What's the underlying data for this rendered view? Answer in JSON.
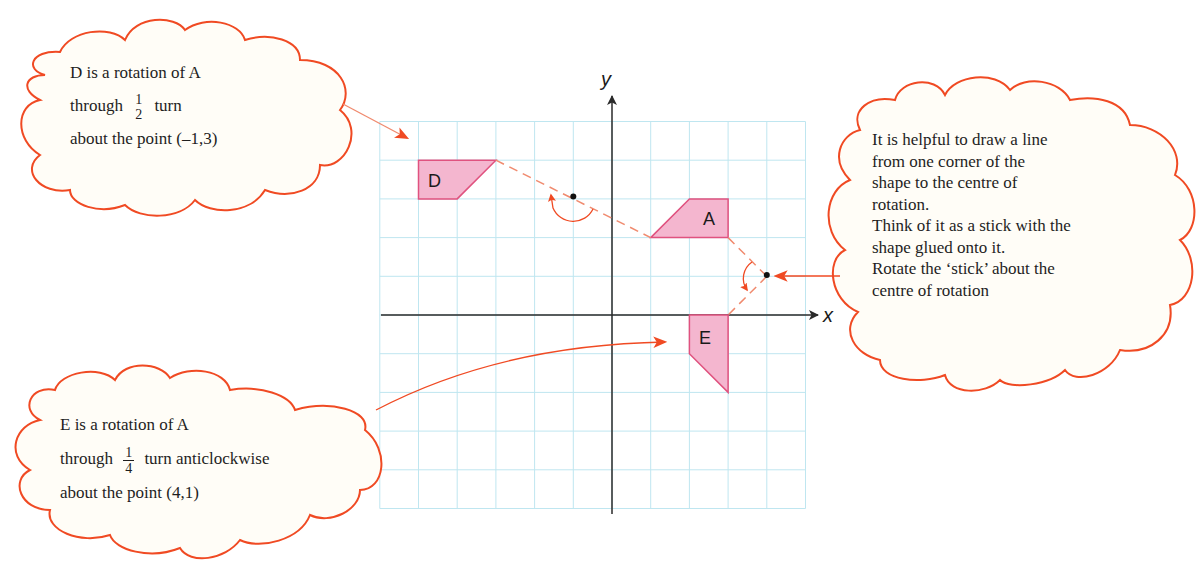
{
  "colors": {
    "grid": "#bfe6f0",
    "axis": "#2a2a2a",
    "shape_fill": "#f4b6cf",
    "shape_stroke": "#e0527f",
    "annotation": "#f04a23",
    "cloud_fill": "#fffdf7",
    "text": "#1e1e1e"
  },
  "grid": {
    "origin_px": [
      612,
      315
    ],
    "unit_px": 38.7,
    "x_range": [
      -6,
      5
    ],
    "y_range": [
      -5,
      5
    ]
  },
  "axes": {
    "x_label": "x",
    "y_label": "y"
  },
  "shapes": {
    "A": {
      "label": "A",
      "vertices": [
        [
          1,
          2
        ],
        [
          2,
          3
        ],
        [
          3,
          3
        ],
        [
          3,
          2
        ]
      ]
    },
    "D": {
      "label": "D",
      "vertices": [
        [
          -3,
          4
        ],
        [
          -4,
          3
        ],
        [
          -5,
          3
        ],
        [
          -5,
          4
        ]
      ]
    },
    "E": {
      "label": "E",
      "vertices": [
        [
          3,
          0
        ],
        [
          3,
          -2
        ],
        [
          2,
          -1
        ],
        [
          2,
          0
        ]
      ]
    }
  },
  "centres": {
    "D_centre": [
      -1,
      3
    ],
    "E_centre": [
      4,
      1
    ]
  },
  "cloud_d": {
    "line1": "D is a rotation of A",
    "line2_pre": "through",
    "frac_num": "1",
    "frac_den": "2",
    "line2_post": "turn",
    "line3": "about the point (–1,3)"
  },
  "cloud_e": {
    "line1": "E is a rotation of A",
    "line2_pre": "through",
    "frac_num": "1",
    "frac_den": "4",
    "line2_post": "turn anticlockwise",
    "line3": "about the point (4,1)"
  },
  "cloud_tip": {
    "lines": [
      "It is helpful to draw a line",
      "from one corner of the",
      "shape to the centre of",
      "rotation.",
      "Think of it as a stick with the",
      "shape glued onto it.",
      "Rotate the ‘stick’ about the",
      "centre of rotation"
    ]
  }
}
